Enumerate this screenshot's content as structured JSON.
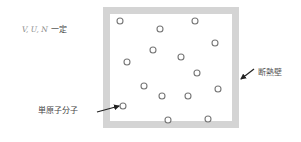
{
  "condition": {
    "variables": "V, U, N",
    "suffix": "一定"
  },
  "labels": {
    "wall": "断熱壁",
    "molecule": "単原子分子"
  },
  "colors": {
    "wall": "#d4d4d4",
    "molecule_stroke": "#777777",
    "arrow": "#222222",
    "text": "#444444"
  },
  "box": {
    "x": 103,
    "y": 7,
    "width": 136,
    "height": 121,
    "wall_thickness": 7
  },
  "molecules": [
    {
      "x": 120,
      "y": 21
    },
    {
      "x": 160,
      "y": 29
    },
    {
      "x": 195,
      "y": 21
    },
    {
      "x": 215,
      "y": 43
    },
    {
      "x": 153,
      "y": 50
    },
    {
      "x": 181,
      "y": 57
    },
    {
      "x": 127,
      "y": 62
    },
    {
      "x": 197,
      "y": 73
    },
    {
      "x": 144,
      "y": 86
    },
    {
      "x": 218,
      "y": 89
    },
    {
      "x": 162,
      "y": 96
    },
    {
      "x": 188,
      "y": 96
    },
    {
      "x": 123,
      "y": 106
    },
    {
      "x": 168,
      "y": 120
    },
    {
      "x": 208,
      "y": 119
    }
  ],
  "arrows": {
    "wall": {
      "from": [
        254,
        69
      ],
      "to": [
        241,
        79
      ]
    },
    "molecule": {
      "from": [
        97,
        112
      ],
      "to": [
        119,
        106
      ]
    }
  }
}
